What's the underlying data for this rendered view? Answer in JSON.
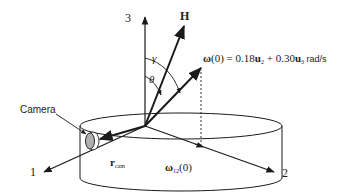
{
  "diagram": {
    "axes": {
      "axis1_label": "1",
      "axis2_label": "2",
      "axis3_label": "3"
    },
    "vectors": {
      "H_label": "H",
      "omega_eq_omega": "ω",
      "omega_eq_rest": "(0) = 0.18",
      "u2": "u",
      "u2_sub": "2",
      "plus": " + 0.30",
      "u3": "u",
      "u3_sub": "3",
      "units": " rad/s",
      "omega12_omega": "ω",
      "omega12_sub": "12",
      "omega12_rest": "(0)",
      "rcam_r": "r",
      "rcam_sub": "cam"
    },
    "angles": {
      "gamma": "γ",
      "theta": "θ"
    },
    "camera_label": "Camera",
    "colors": {
      "line": "#1a1a1a",
      "camera_fill": "#b0b0b0"
    }
  }
}
